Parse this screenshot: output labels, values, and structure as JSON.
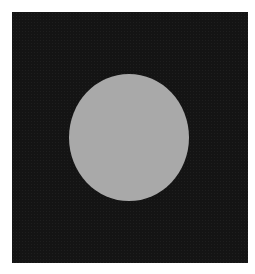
{
  "image": {
    "description": "Light gray circular disc centered on a dark, noisy square background",
    "background_color": "#ffffff",
    "panel_color": "#141414",
    "disc_color": "#a9a9a9"
  }
}
